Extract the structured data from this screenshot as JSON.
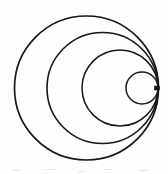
{
  "figure": {
    "background_color": "#fefefe",
    "ink_color": "#17161a",
    "canvas": {
      "width": 168,
      "height": 174
    },
    "tangency_point": {
      "x": 158,
      "y": 88
    },
    "circle_count": 4
  },
  "chart_data": {
    "type": "scatter",
    "xlabel": "",
    "ylabel": "",
    "xlim": [
      0,
      168
    ],
    "ylim": [
      0,
      174
    ],
    "grid": false,
    "legend": "none",
    "annotations": [
      "All four circles are internally tangent at a single common point on the right",
      "Hand-drawn ink on white paper"
    ],
    "series": [
      {
        "name": "circle-1-outermost",
        "cx": 86.5,
        "cy": 88,
        "r": 72,
        "diameter": 144,
        "stroke_width": 1.7,
        "left_edge_x": 15,
        "right_edge_x": 158,
        "top_edge_y": 14,
        "bottom_edge_y": 162
      },
      {
        "name": "circle-2",
        "cx": 102.5,
        "cy": 88,
        "r": 55.5,
        "diameter": 111,
        "stroke_width": 1.6,
        "left_edge_x": 47,
        "right_edge_x": 158,
        "top_edge_y": 38,
        "bottom_edge_y": 138
      },
      {
        "name": "circle-3",
        "cx": 120,
        "cy": 88,
        "r": 38,
        "diameter": 76,
        "stroke_width": 1.5,
        "left_edge_x": 82,
        "right_edge_x": 158,
        "top_edge_y": 51,
        "bottom_edge_y": 124
      },
      {
        "name": "circle-4-innermost",
        "cx": 142,
        "cy": 88,
        "r": 16,
        "diameter": 32,
        "stroke_width": 1.5,
        "left_edge_x": 126,
        "right_edge_x": 158,
        "top_edge_y": 72,
        "bottom_edge_y": 104
      }
    ],
    "markers": [
      {
        "name": "tangency-point-marker",
        "shape": "square",
        "x": 157,
        "y": 88,
        "width": 5,
        "height": 4
      }
    ]
  }
}
